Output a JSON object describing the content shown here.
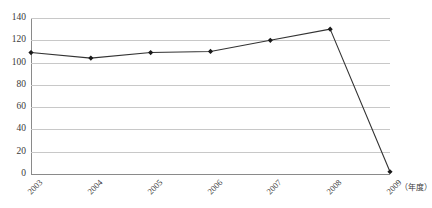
{
  "chart_data": {
    "type": "line",
    "title": "",
    "subtitle": "",
    "xlabel": "（年度）",
    "ylabel": "",
    "categories": [
      "2003",
      "2004",
      "2005",
      "2006",
      "2007",
      "2008",
      "2009"
    ],
    "values": [
      109,
      104,
      109,
      110,
      120,
      130,
      2
    ],
    "series": [
      {
        "name": "series-1",
        "values": [
          109,
          104,
          109,
          110,
          120,
          130,
          2
        ],
        "color": "#333333",
        "marker": "diamond"
      }
    ],
    "xlim": [
      "2003",
      "2009"
    ],
    "ylim": [
      0,
      140
    ],
    "y_ticks": [
      0,
      20,
      40,
      60,
      80,
      100,
      120,
      140
    ],
    "y_tick_labels": [
      "0",
      "20",
      "40",
      "60",
      "80",
      "100",
      "120",
      "140"
    ],
    "x_tick_labels": [
      "2003",
      "2004",
      "2005",
      "2006",
      "2007",
      "2008",
      "2009"
    ],
    "x_tick_rotation": -45,
    "grid": true,
    "grid_axis": "y",
    "grid_color": "#c8c8c8",
    "legend": false,
    "legend_position": "none",
    "annotations": [],
    "axis_color": "#8a8a8a",
    "background_color": "#ffffff"
  },
  "chart": {
    "unit_label": "（年度）",
    "line_color": "#333333",
    "marker_color": "#1a1a1a"
  }
}
